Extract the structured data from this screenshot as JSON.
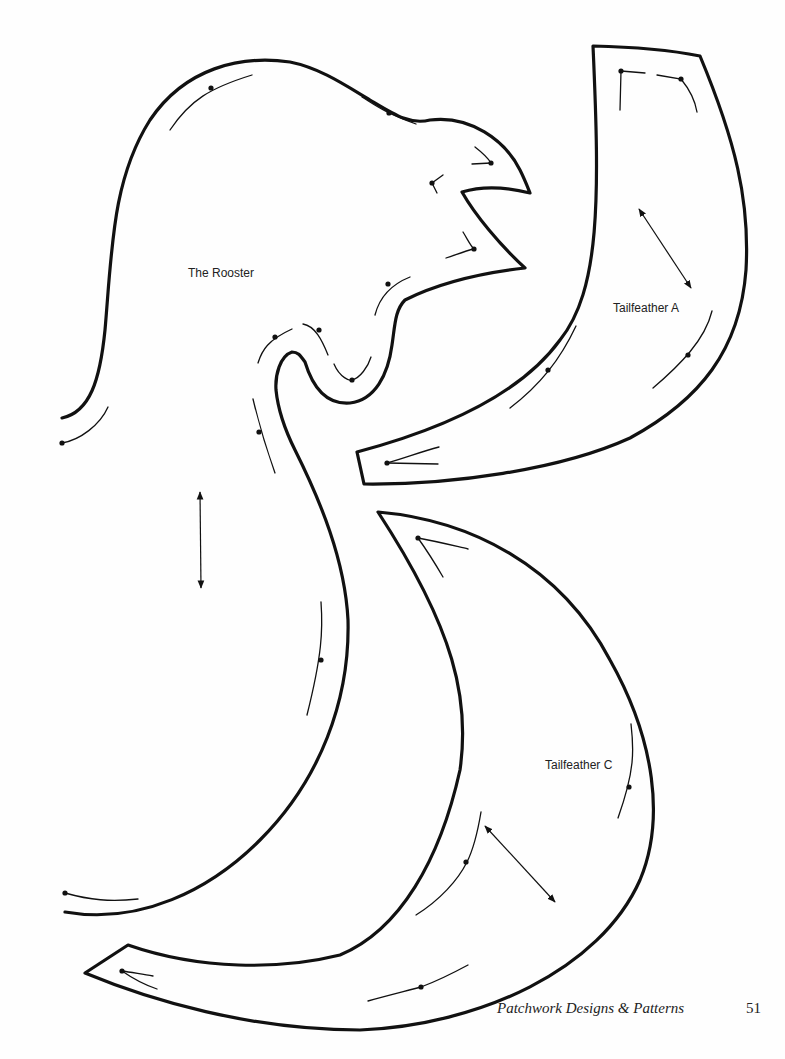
{
  "page": {
    "type": "pattern-template-page",
    "background": "#fefefe",
    "ink_color": "#111111"
  },
  "pieces": [
    {
      "id": "rooster",
      "label": "The Rooster"
    },
    {
      "id": "tailfeather-a",
      "label": "Tailfeather A"
    },
    {
      "id": "tailfeather-c",
      "label": "Tailfeather C"
    }
  ],
  "footer": {
    "title": "Patchwork Designs & Patterns",
    "page_number": "51"
  },
  "icons": {
    "grain-arrow": "double-headed-arrow",
    "seam-dot": "filled-circle"
  }
}
